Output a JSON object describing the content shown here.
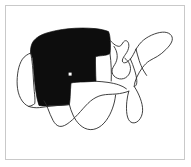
{
  "figure": {
    "title": "",
    "caption": "",
    "frame_color": "#c9c9c9",
    "background_color": "#ffffff",
    "highlight_color": "#0d0d0d",
    "outline_color": "#2b2b2b",
    "marker_color": "#ffffff"
  },
  "map": {
    "region_name": "United States",
    "projection_note": "contiguous-48-states",
    "highlighted_label": "Western and Northern Plains states",
    "unhighlighted_label": "Remaining states",
    "marker_label": "point-marker"
  },
  "chart_data": {
    "type": "map",
    "title": "",
    "categories": [
      "highlighted",
      "not-highlighted"
    ],
    "values": [
      1,
      0
    ],
    "legend": [],
    "annotations": [
      {
        "name": "marker",
        "x": 70,
        "y": 74
      }
    ]
  },
  "regions": {
    "highlighted_outline": "M 31,52 L 31,40 L 38,33 L 52,30 L 66,28 L 82,28 L 97,30 L 108,33 L 110,46 L 110,56 L 108,62 L 96,62 L 96,74 L 96,86 L 82,86 L 72,88 L 68,96 L 60,104 L 48,106 L 40,104 L 36,96 L 34,86 L 33,74 L 31,62 Z",
    "california_outline": "M 30,52 L 24,55 L 20,62 L 18,72 L 17,82 L 19,92 L 24,100 L 30,104 L 33,100 L 32,88 L 31,74 L 30,62 Z",
    "eastern_outline": "M 110,46 L 118,44 L 122,40 L 126,42 L 128,48 L 124,54 L 122,60 L 126,62 L 132,58 L 136,50 L 140,44 L 146,40 L 152,36 L 158,33 L 164,32 L 170,34 L 172,40 L 168,46 L 164,52 L 158,56 L 152,58 L 148,62 L 144,66 L 140,72 L 136,78 L 134,86 L 138,94 L 142,104 L 140,114 L 134,120 L 128,118 L 124,110 L 120,102 L 114,96 L 106,94 L 98,96 L 92,100 L 86,108 L 80,116 L 72,124 L 64,128 L 58,124 L 54,116 L 50,108 L 48,106",
    "great_lakes_outline": "M 110,46 L 114,50 L 116,56 L 114,62 L 112,68 L 114,74 L 118,78 L 124,78 L 128,74 L 130,68 L 128,62 L 124,58",
    "texas_outline": "M 68,96 L 70,104 L 74,112 L 78,120 L 84,126 L 92,130 L 100,128 L 106,122 L 110,114 L 112,106 L 114,98",
    "florida_outline": "M 134,86 L 138,96 L 140,106 L 138,116 L 134,122 L 130,120 L 128,112 L 128,102 L 130,94"
  }
}
